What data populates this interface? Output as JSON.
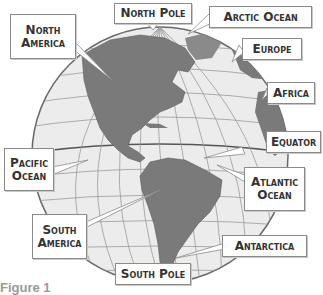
{
  "diagram": {
    "caption": "Figure 1",
    "colors": {
      "ocean": "#ececec",
      "land": "#7a7a7a",
      "grid": "#9a9a9a",
      "outline": "#6a6a6a",
      "label_border": "#8a8a8a",
      "label_text": "#333333"
    },
    "labels": {
      "north_pole": "North Pole",
      "arctic_ocean": "Arctic Ocean",
      "north_america_line1": "North",
      "north_america_line2": "America",
      "europe": "Europe",
      "africa": "Africa",
      "equator": "Equator",
      "pacific_line1": "Pacific",
      "pacific_line2": "Ocean",
      "atlantic_line1": "Atlantic",
      "atlantic_line2": "Ocean",
      "south_america_line1": "South",
      "south_america_line2": "America",
      "antarctica": "Antarctica",
      "south_pole": "South Pole"
    }
  }
}
